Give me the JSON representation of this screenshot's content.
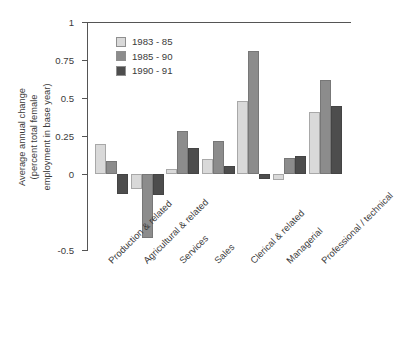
{
  "chart_data": {
    "type": "bar",
    "title": "",
    "xlabel": "",
    "ylabel": "Average annual change (percent total female employment in base year)",
    "ylabel_lines": [
      "Average annual change",
      "(percent total female",
      "employment in base year)"
    ],
    "categories": [
      "Production & related",
      "Agricultural & related",
      "Services",
      "Sales",
      "Clerical & related",
      "Managerial",
      "Professional / technical"
    ],
    "series": [
      {
        "name": "1983 - 85",
        "color": "#d9d9d9",
        "values": [
          0.2,
          -0.1,
          0.03,
          0.1,
          0.48,
          -0.04,
          0.41
        ]
      },
      {
        "name": "1985 - 90",
        "color": "#8c8c8c",
        "values": [
          0.085,
          -0.42,
          0.28,
          0.22,
          0.81,
          0.105,
          0.62
        ]
      },
      {
        "name": "1990 - 91",
        "color": "#4d4d4d",
        "values": [
          -0.13,
          -0.14,
          0.17,
          0.05,
          -0.035,
          0.12,
          0.45
        ]
      }
    ],
    "ylim": [
      -0.5,
      1
    ],
    "yticks": [
      1,
      0.75,
      0.5,
      0.25,
      0,
      -0.5
    ],
    "ytick_labels": [
      "1",
      "0.75",
      "0.5",
      "0.25",
      "0",
      "-0.5"
    ],
    "grid": false,
    "legend_position": "top-left-inside",
    "zero_line": true
  }
}
